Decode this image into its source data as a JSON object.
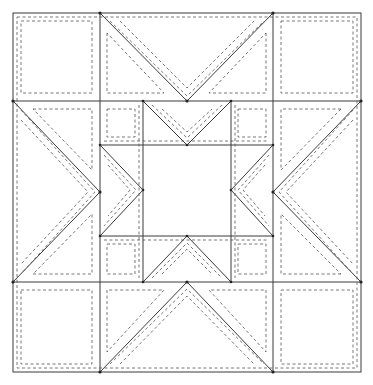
{
  "diagram": {
    "size": {
      "width": 373,
      "height": 385
    },
    "colors": {
      "cut_line": "#3a3a3a",
      "seam_line": "#555555",
      "background": "#ffffff"
    },
    "grid": {
      "x": [
        13,
        100,
        143,
        231,
        273,
        361
      ],
      "y": [
        13,
        101,
        145,
        236,
        282,
        372
      ]
    },
    "pieces": [
      {
        "name": "corner-square-top-left",
        "type": "square"
      },
      {
        "name": "corner-square-top-right",
        "type": "square"
      },
      {
        "name": "corner-square-bottom-left",
        "type": "square"
      },
      {
        "name": "corner-square-bottom-right",
        "type": "square"
      },
      {
        "name": "flying-geese-top",
        "type": "triangle-unit"
      },
      {
        "name": "flying-geese-bottom",
        "type": "triangle-unit"
      },
      {
        "name": "flying-geese-left",
        "type": "triangle-unit"
      },
      {
        "name": "flying-geese-right",
        "type": "triangle-unit"
      },
      {
        "name": "inner-star",
        "type": "ohio-star-center"
      },
      {
        "name": "center-square",
        "type": "square"
      }
    ],
    "legend": {
      "solid": "cutting line",
      "dashed": "seam line"
    }
  }
}
